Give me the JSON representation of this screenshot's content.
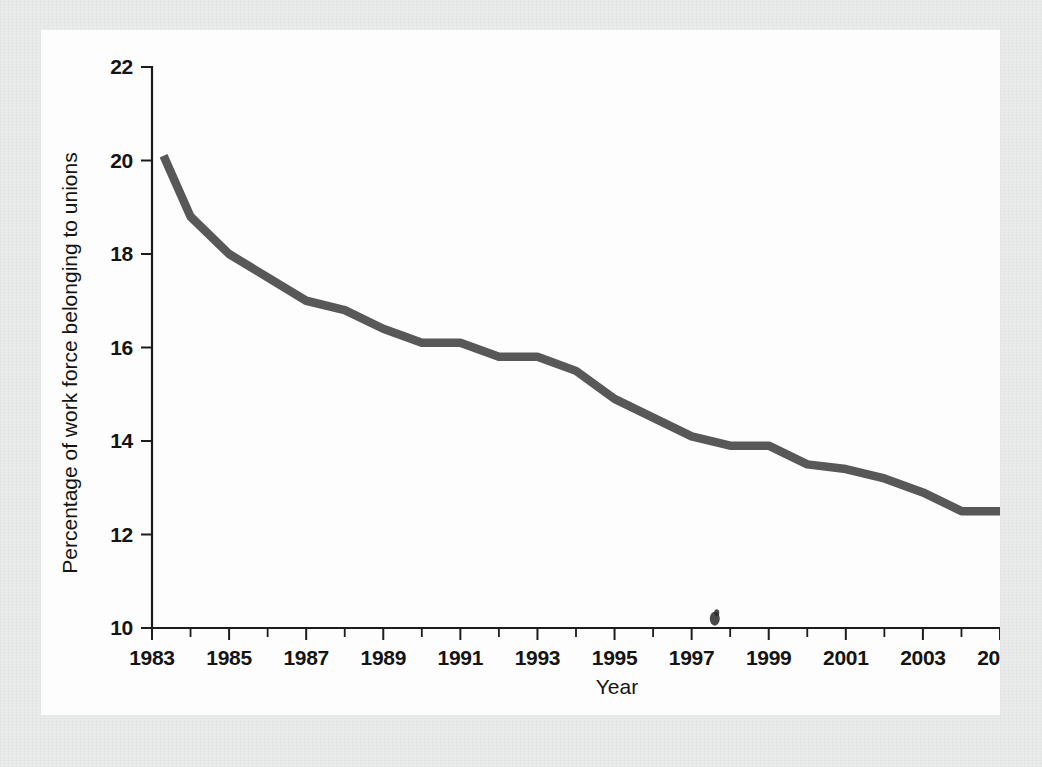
{
  "page": {
    "background_color": "#e9eaea",
    "sheet_color": "#fdfdfd"
  },
  "chart_data": {
    "type": "line",
    "title": "",
    "subtitle": "",
    "xlabel": "Year",
    "ylabel": "Percentage of work force belonging to unions",
    "xlim": [
      1983,
      2005
    ],
    "ylim": [
      10,
      22
    ],
    "grid": false,
    "legend": null,
    "line_color": "#585858",
    "axis_color": "#141414",
    "x_tick_labels": [
      "1983",
      "1985",
      "1987",
      "1989",
      "1991",
      "1993",
      "1995",
      "1997",
      "1999",
      "2001",
      "2003",
      "2005"
    ],
    "x_tick_values": [
      1983,
      1985,
      1987,
      1989,
      1991,
      1993,
      1995,
      1997,
      1999,
      2001,
      2003,
      2005
    ],
    "x_minor_ticks": [
      1984,
      1986,
      1988,
      1990,
      1992,
      1994,
      1996,
      1998,
      2000,
      2002,
      2004
    ],
    "y_tick_labels": [
      "10",
      "12",
      "14",
      "16",
      "18",
      "20",
      "22"
    ],
    "y_tick_values": [
      10,
      12,
      14,
      16,
      18,
      20,
      22
    ],
    "series": [
      {
        "name": "Percentage of work force belonging to unions",
        "x": [
          1983.3,
          1984,
          1985,
          1986,
          1987,
          1988,
          1989,
          1990,
          1991,
          1992,
          1993,
          1994,
          1995,
          1996,
          1997,
          1998,
          1999,
          2000,
          2001,
          2002,
          2003,
          2004,
          2005
        ],
        "values": [
          20.1,
          18.8,
          18.0,
          17.5,
          17.0,
          16.8,
          16.4,
          16.1,
          16.1,
          15.8,
          15.8,
          15.5,
          14.9,
          14.5,
          14.1,
          13.9,
          13.9,
          13.5,
          13.4,
          13.2,
          12.9,
          12.5,
          12.5
        ]
      }
    ],
    "annotations": [
      {
        "name": "ink-smudge",
        "x": 1997.6,
        "y": 10.2
      }
    ]
  }
}
